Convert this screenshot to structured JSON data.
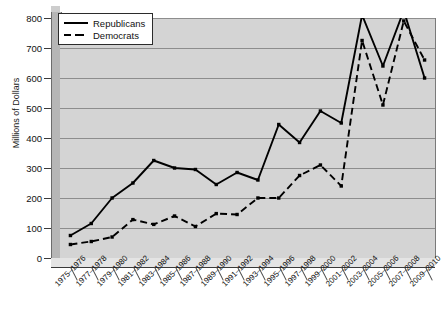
{
  "chart_data": {
    "type": "line",
    "title": "",
    "xlabel": "",
    "ylabel": "Millions of Dollars",
    "ylim": [
      0,
      800
    ],
    "yticks": [
      0,
      100,
      200,
      300,
      400,
      500,
      600,
      700,
      800
    ],
    "grid": true,
    "legend_position": "top-left",
    "categories": [
      "1975–1976",
      "1977–1978",
      "1979–1980",
      "1981–1982",
      "1983–1984",
      "1985–1986",
      "1987–1988",
      "1989–1990",
      "1991–1992",
      "1993–1994",
      "1995–1996",
      "1997–1998",
      "1999–2000",
      "2001–2002",
      "2003–2004",
      "2005–2006",
      "2007–2008",
      "2009–2010"
    ],
    "series": [
      {
        "name": "Republicans",
        "style": "solid",
        "color": "#000000",
        "values": [
          75,
          115,
          200,
          250,
          325,
          300,
          295,
          245,
          285,
          260,
          445,
          385,
          490,
          450,
          810,
          640,
          825,
          600
        ]
      },
      {
        "name": "Democrats",
        "style": "dashed",
        "color": "#000000",
        "values": [
          45,
          55,
          70,
          128,
          112,
          140,
          105,
          148,
          145,
          200,
          200,
          275,
          310,
          240,
          725,
          510,
          790,
          660
        ]
      }
    ]
  },
  "legend": {
    "items": [
      {
        "label": "Republicans",
        "style": "solid"
      },
      {
        "label": "Democrats",
        "style": "dashed"
      }
    ]
  }
}
